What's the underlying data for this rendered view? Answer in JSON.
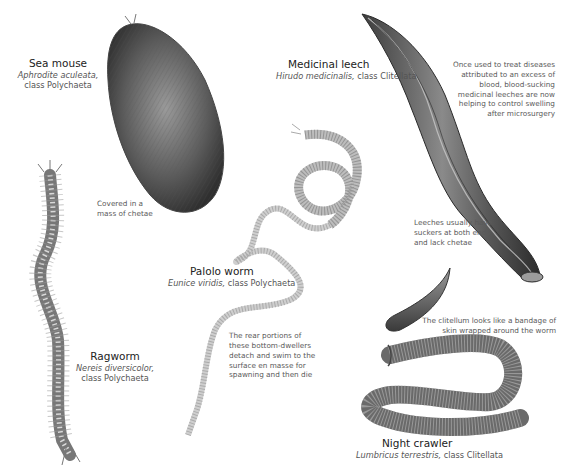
{
  "species": [
    {
      "id": "sea-mouse",
      "name": "Sea mouse",
      "scientific": "Aphrodite aculeata,",
      "class_line": "class Polychaeta",
      "note": "Covered in a mass of chetae",
      "note_lines": [
        "Covered in a",
        "mass of chetae"
      ]
    },
    {
      "id": "medicinal-leech",
      "name": "Medicinal leech",
      "scientific": "Hirudo medicinalis,",
      "class_line": "class Clitellata",
      "note_top_lines": [
        "Once used to treat diseases",
        "attributed to an excess of",
        "blood, blood-sucking",
        "medicinal leeches are now",
        "helping to control swelling",
        "after microsurgery"
      ],
      "note_bottom_lines": [
        "Leeches usually have",
        "suckers at both ends",
        "and lack chetae"
      ]
    },
    {
      "id": "palolo-worm",
      "name": "Palolo worm",
      "scientific": "Eunice viridis,",
      "class_line": "class Polychaeta",
      "note_lines": [
        "The rear portions of",
        "these bottom-dwellers",
        "detach and swim to the",
        "surface en masse for",
        "spawning and then die"
      ]
    },
    {
      "id": "ragworm",
      "name": "Ragworm",
      "scientific": "Nereis diversicolor,",
      "class_line": "class Polychaeta"
    },
    {
      "id": "night-crawler",
      "name": "Night crawler",
      "scientific": "Lumbricus terrestris,",
      "class_line": "class Clitellata",
      "note_lines": [
        "The clitellum looks like a bandage of",
        "skin wrapped around the worm"
      ]
    }
  ],
  "colors": {
    "background": "#ffffff",
    "heading": "#222222",
    "body_text": "#555555",
    "illustration_dark": "#3a3a3a",
    "illustration_mid": "#8a8a8a",
    "illustration_light": "#cfcfcf"
  }
}
